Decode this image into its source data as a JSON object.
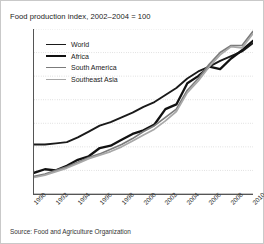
{
  "chart_data": {
    "type": "line",
    "title": "Food production index, 2002–2004 = 100",
    "xlabel": "",
    "ylabel": "",
    "xlim": [
      1990,
      2010
    ],
    "ylim": [
      50,
      120
    ],
    "y_ticks": [
      50,
      60,
      70,
      80,
      90,
      100,
      110,
      120
    ],
    "x_ticks": [
      1990,
      1991,
      1992,
      1993,
      1994,
      1995,
      1996,
      1997,
      1998,
      1999,
      2000,
      2001,
      2002,
      2003,
      2004,
      2005,
      2006,
      2007,
      2008,
      2009,
      2010
    ],
    "x_tick_labels": [
      "1990",
      "1992",
      "1994",
      "1996",
      "1998",
      "2000",
      "2002",
      "2004",
      "2006",
      "2008",
      "2010"
    ],
    "x_tick_label_years": [
      1990,
      1992,
      1994,
      1996,
      1998,
      2000,
      2002,
      2004,
      2006,
      2008,
      2010
    ],
    "grid": true,
    "grid_style": "dotted-horizontal",
    "legend_position": "upper-left-inside",
    "x": [
      1990,
      1991,
      1992,
      1993,
      1994,
      1995,
      1996,
      1997,
      1998,
      1999,
      2000,
      2001,
      2002,
      2003,
      2004,
      2005,
      2006,
      2007,
      2008,
      2009,
      2010
    ],
    "series": [
      {
        "name": "World",
        "color": "#1a1a1a",
        "width": 1.9,
        "values": [
          71,
          71,
          71.5,
          72,
          74,
          76.5,
          79,
          80.5,
          82.5,
          84.5,
          87,
          89,
          92,
          95,
          99,
          102,
          104,
          106.5,
          108.5,
          110.5,
          114
        ]
      },
      {
        "name": "Africa",
        "color": "#111111",
        "width": 2.3,
        "values": [
          59,
          60.5,
          60,
          62,
          64.5,
          66,
          69.5,
          70.5,
          73,
          75.5,
          77,
          79.5,
          86,
          88,
          97,
          100,
          104,
          103,
          107.5,
          111,
          115
        ]
      },
      {
        "name": "South America",
        "color": "#7b7b7b",
        "width": 1.7,
        "values": [
          57.5,
          58.5,
          60,
          61.5,
          63.5,
          65.5,
          67,
          69,
          71,
          73.5,
          76.5,
          79,
          82.5,
          86,
          94,
          99,
          105,
          110,
          113,
          113,
          119
        ]
      },
      {
        "name": "Southeast Asia",
        "color": "#a8a8a8",
        "width": 1.7,
        "values": [
          57,
          58,
          59.5,
          61,
          63,
          65,
          66.5,
          68,
          70,
          72.5,
          75,
          77.5,
          81,
          85,
          93,
          98,
          104,
          109,
          112.5,
          112,
          118
        ]
      }
    ]
  },
  "legend": {
    "items": [
      {
        "label": "World"
      },
      {
        "label": "Africa"
      },
      {
        "label": "South America"
      },
      {
        "label": "Southeast Asia"
      }
    ]
  },
  "source": {
    "text": "Source: Food and Agriculture Organization"
  }
}
